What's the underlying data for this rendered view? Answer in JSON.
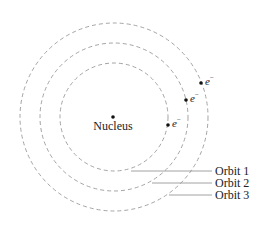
{
  "diagram": {
    "title": "",
    "nucleus": {
      "label": "Nucleus"
    },
    "orbits": [
      {
        "label": "Orbit 1",
        "radius": 54
      },
      {
        "label": "Orbit 2",
        "radius": 74
      },
      {
        "label": "Orbit 3",
        "radius": 94
      }
    ],
    "electrons": [
      {
        "orbit": 1,
        "symbol": "e",
        "charge": "−"
      },
      {
        "orbit": 2,
        "symbol": "e",
        "charge": "−"
      },
      {
        "orbit": 3,
        "symbol": "e",
        "charge": "−"
      }
    ],
    "colors": {
      "orbit_stroke": "#9a9a9a",
      "leader_line": "#8a8a8a",
      "dot": "#111111",
      "text": "#222222"
    }
  }
}
